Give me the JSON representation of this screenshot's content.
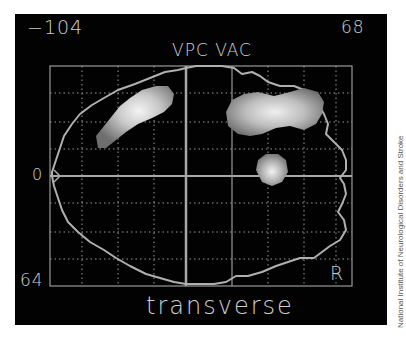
{
  "image": {
    "description": "PET brain scan, transverse slice, with grid overlay and highlighted activity regions",
    "labels": {
      "top_left_value": "−104",
      "top_right_value": "68",
      "title": "VPC VAC",
      "left_axis_marker": "0",
      "bottom_left_value": "64",
      "orientation_marker": "R",
      "plane_label": "transverse"
    },
    "credit": "National Institute of Neurological Disorders and Stroke",
    "colors": {
      "background": "#020202",
      "grid": "#9a9a9a",
      "outline": "#b0b0b0",
      "text": "#cfcfcf",
      "activity_low": "#6a6a6a",
      "activity_high": "#f2f2f2"
    }
  }
}
